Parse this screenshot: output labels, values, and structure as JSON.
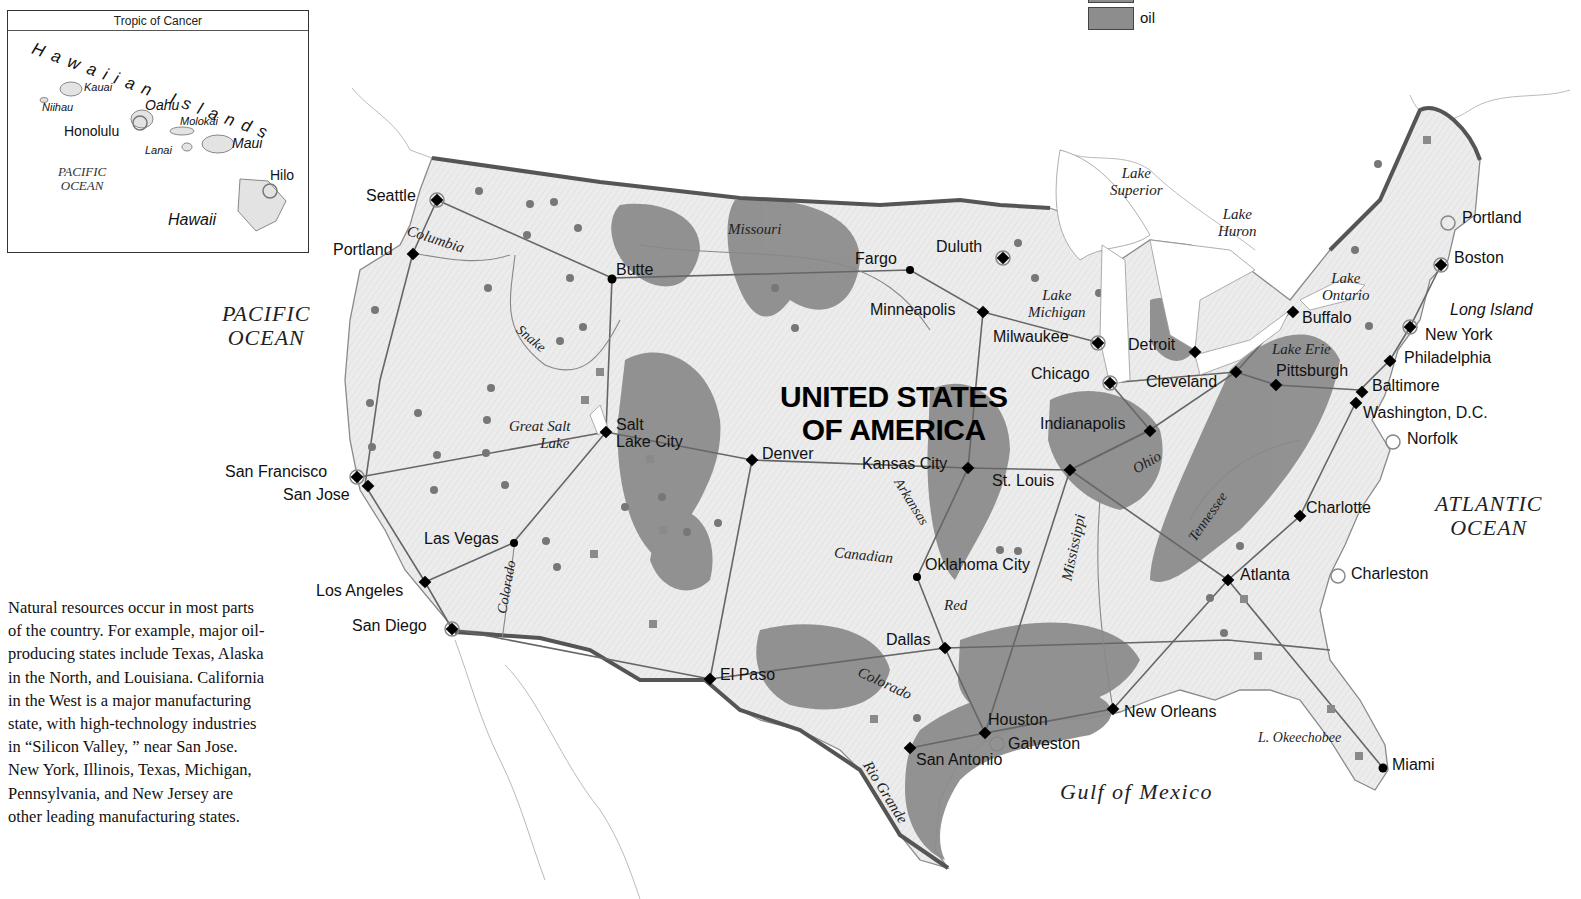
{
  "legend": {
    "items": [
      {
        "label": "oil",
        "color": "#8d8d8d"
      }
    ]
  },
  "inset": {
    "title": "Tropic of Cancer",
    "chain_label": "Hawaiian Islands",
    "islands": [
      "Kauai",
      "Niihau",
      "Oahu",
      "Molokai",
      "Lanai",
      "Maui",
      "Hawaii"
    ],
    "cities": [
      "Honolulu",
      "Hilo"
    ],
    "ocean": [
      "PACIFIC",
      "OCEAN"
    ]
  },
  "caption": "Natural resources occur in most parts of the country. For example, major oil-producing states include Texas, Alaska in the North, and Louisiana. California in the West is a major manufacturing state, with high-technology industries in “Silicon Valley, ” near San Jose. New York, Illinois, Texas, Michigan, Pennsylvania, and New Jersey are other leading manufacturing states.",
  "map": {
    "country_label": [
      "UNITED STATES",
      "OF AMERICA"
    ],
    "oceans": {
      "pacific": [
        "PACIFIC",
        "OCEAN"
      ],
      "atlantic": [
        "ATLANTIC",
        "OCEAN"
      ],
      "gulf": "Gulf of Mexico"
    },
    "cities": [
      {
        "name": "Seattle"
      },
      {
        "name": "Portland"
      },
      {
        "name": "Butte"
      },
      {
        "name": "Salt"
      },
      {
        "name": "Lake City"
      },
      {
        "name": "San Francisco"
      },
      {
        "name": "San Jose"
      },
      {
        "name": "Las Vegas"
      },
      {
        "name": "Los Angeles"
      },
      {
        "name": "San Diego"
      },
      {
        "name": "El Paso"
      },
      {
        "name": "Denver"
      },
      {
        "name": "Fargo"
      },
      {
        "name": "Duluth"
      },
      {
        "name": "Minneapolis"
      },
      {
        "name": "Milwaukee"
      },
      {
        "name": "Chicago"
      },
      {
        "name": "Detroit"
      },
      {
        "name": "Cleveland"
      },
      {
        "name": "Indianapolis"
      },
      {
        "name": "Kansas City"
      },
      {
        "name": "St. Louis"
      },
      {
        "name": "Oklahoma City"
      },
      {
        "name": "Dallas"
      },
      {
        "name": "Houston"
      },
      {
        "name": "Galveston"
      },
      {
        "name": "San Antonio"
      },
      {
        "name": "New Orleans"
      },
      {
        "name": "Atlanta"
      },
      {
        "name": "Charlotte"
      },
      {
        "name": "Charleston"
      },
      {
        "name": "Miami"
      },
      {
        "name": "Pittsburgh"
      },
      {
        "name": "Buffalo"
      },
      {
        "name": "Baltimore"
      },
      {
        "name": "Washington, D.C."
      },
      {
        "name": "Norfolk"
      },
      {
        "name": "Philadelphia"
      },
      {
        "name": "New York"
      },
      {
        "name": "Boston"
      },
      {
        "name": "Portland"
      },
      {
        "name": "Long Island"
      }
    ],
    "rivers": [
      "Columbia",
      "Snake",
      "Missouri",
      "Colorado",
      "Arkansas",
      "Canadian",
      "Red",
      "Colorado",
      "Rio Grande",
      "Mississippi",
      "Ohio",
      "Tennessee"
    ],
    "lakes": [
      [
        "Great Salt",
        "Lake"
      ],
      [
        "Lake",
        "Superior"
      ],
      [
        "Lake",
        "Huron"
      ],
      [
        "Lake",
        "Michigan"
      ],
      [
        "Lake",
        "Ontario"
      ],
      [
        "Lake Erie"
      ],
      [
        "L. Okeechobee"
      ]
    ]
  }
}
